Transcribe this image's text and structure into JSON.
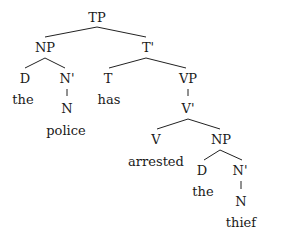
{
  "diagram": {
    "type": "syntax-tree",
    "nodes": [
      {
        "id": "TP",
        "label": "TP",
        "x": 97,
        "y": 18,
        "kind": "category"
      },
      {
        "id": "NP1",
        "label": "NP",
        "x": 45,
        "y": 48,
        "kind": "category"
      },
      {
        "id": "T1",
        "label": "T'",
        "x": 148,
        "y": 48,
        "kind": "category"
      },
      {
        "id": "D1",
        "label": "D",
        "x": 25,
        "y": 79,
        "kind": "category"
      },
      {
        "id": "N1bar",
        "label": "N'",
        "x": 67,
        "y": 79,
        "kind": "category"
      },
      {
        "id": "the1",
        "label": "the",
        "x": 23,
        "y": 100,
        "kind": "word"
      },
      {
        "id": "N1",
        "label": "N",
        "x": 67,
        "y": 109,
        "kind": "category"
      },
      {
        "id": "police",
        "label": "police",
        "x": 66,
        "y": 131,
        "kind": "word"
      },
      {
        "id": "T",
        "label": "T",
        "x": 108,
        "y": 79,
        "kind": "category"
      },
      {
        "id": "has",
        "label": "has",
        "x": 109,
        "y": 100,
        "kind": "word"
      },
      {
        "id": "VP",
        "label": "VP",
        "x": 188,
        "y": 79,
        "kind": "category"
      },
      {
        "id": "Vbar",
        "label": "V'",
        "x": 188,
        "y": 109,
        "kind": "category"
      },
      {
        "id": "V",
        "label": "V",
        "x": 156,
        "y": 140,
        "kind": "category"
      },
      {
        "id": "arrested",
        "label": "arrested",
        "x": 156,
        "y": 162,
        "kind": "word"
      },
      {
        "id": "NP2",
        "label": "NP",
        "x": 221,
        "y": 140,
        "kind": "category"
      },
      {
        "id": "D2",
        "label": "D",
        "x": 202,
        "y": 171,
        "kind": "category"
      },
      {
        "id": "the2",
        "label": "the",
        "x": 203,
        "y": 192,
        "kind": "word"
      },
      {
        "id": "N2bar",
        "label": "N'",
        "x": 240,
        "y": 171,
        "kind": "category"
      },
      {
        "id": "N2",
        "label": "N",
        "x": 241,
        "y": 202,
        "kind": "category"
      },
      {
        "id": "thief",
        "label": "thief",
        "x": 241,
        "y": 223,
        "kind": "word"
      }
    ],
    "edges": [
      {
        "from": "TP",
        "to": "NP1",
        "x1": 97,
        "y1": 27,
        "x2": 45,
        "y2": 37
      },
      {
        "from": "TP",
        "to": "T1",
        "x1": 97,
        "y1": 27,
        "x2": 146,
        "y2": 37
      },
      {
        "from": "NP1",
        "to": "D1",
        "x1": 45,
        "y1": 58,
        "x2": 25,
        "y2": 68
      },
      {
        "from": "NP1",
        "to": "N1bar",
        "x1": 45,
        "y1": 58,
        "x2": 65,
        "y2": 68
      },
      {
        "from": "N1bar",
        "to": "N1",
        "x1": 67,
        "y1": 89,
        "x2": 67,
        "y2": 96
      },
      {
        "from": "T1",
        "to": "T",
        "x1": 146,
        "y1": 58,
        "x2": 109,
        "y2": 68
      },
      {
        "from": "T1",
        "to": "VP",
        "x1": 146,
        "y1": 58,
        "x2": 186,
        "y2": 68
      },
      {
        "from": "VP",
        "to": "Vbar",
        "x1": 188,
        "y1": 89,
        "x2": 188,
        "y2": 96
      },
      {
        "from": "Vbar",
        "to": "V",
        "x1": 188,
        "y1": 119,
        "x2": 157,
        "y2": 129
      },
      {
        "from": "Vbar",
        "to": "NP2",
        "x1": 188,
        "y1": 119,
        "x2": 220,
        "y2": 129
      },
      {
        "from": "NP2",
        "to": "D2",
        "x1": 220,
        "y1": 150,
        "x2": 204,
        "y2": 160
      },
      {
        "from": "NP2",
        "to": "N2bar",
        "x1": 220,
        "y1": 150,
        "x2": 242,
        "y2": 160
      },
      {
        "from": "N2bar",
        "to": "N2",
        "x1": 241,
        "y1": 181,
        "x2": 241,
        "y2": 189
      }
    ],
    "colors": {
      "line": "#222222",
      "text": "#1a1a1a",
      "background": "#ffffff"
    }
  }
}
